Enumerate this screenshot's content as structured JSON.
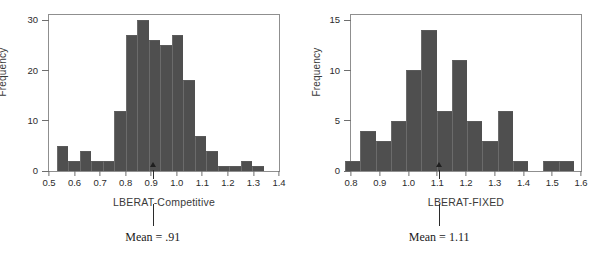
{
  "figure": {
    "panels": [
      "LBERAT-Competitive",
      "LBERAT-FIXED"
    ],
    "bar_color": "#4f4f4f",
    "axis_color": "#8f8f8f",
    "background": "#ffffff"
  },
  "left": {
    "ylabel": "Frequency",
    "xlabel": "LBERAT-Competitive",
    "mean_label": "Mean = .91",
    "yticks": [
      "0",
      "10",
      "20",
      "30"
    ],
    "xticks": [
      "0.5",
      "0.6",
      "0.7",
      "0.8",
      "0.9",
      "1.0",
      "1.1",
      "1.2",
      "1.3",
      "1.4"
    ]
  },
  "right": {
    "ylabel": "Frequency",
    "xlabel": "LBERAT-FIXED",
    "mean_label": "Mean = 1.11",
    "yticks": [
      "0",
      "5",
      "10",
      "15"
    ],
    "xticks": [
      "0.8",
      "0.9",
      "1.0",
      "1.1",
      "1.2",
      "1.3",
      "1.4",
      "1.5",
      "1.6"
    ]
  },
  "chart_data": [
    {
      "type": "bar",
      "title": "",
      "xlabel": "LBERAT-Competitive",
      "ylabel": "Frequency",
      "xlim": [
        0.5,
        1.4
      ],
      "ylim": [
        0,
        31
      ],
      "yticks": [
        0,
        10,
        20,
        30
      ],
      "xticks": [
        0.5,
        0.6,
        0.7,
        0.8,
        0.9,
        1.0,
        1.1,
        1.2,
        1.3,
        1.4
      ],
      "grid": false,
      "legend": "none",
      "bin_width": 0.045,
      "bin_starts": [
        0.53,
        0.575,
        0.62,
        0.665,
        0.71,
        0.755,
        0.8,
        0.845,
        0.89,
        0.935,
        0.98,
        1.025,
        1.07,
        1.115,
        1.16,
        1.205,
        1.25,
        1.295
      ],
      "categories": [
        "0.530",
        "0.575",
        "0.620",
        "0.665",
        "0.710",
        "0.755",
        "0.800",
        "0.845",
        "0.890",
        "0.935",
        "0.980",
        "1.025",
        "1.070",
        "1.115",
        "1.160",
        "1.205",
        "1.250",
        "1.295"
      ],
      "values": [
        5,
        2,
        4,
        2,
        2,
        12,
        27,
        30,
        26,
        25,
        27,
        18,
        7,
        4,
        1,
        1,
        2,
        1
      ],
      "annotations": [
        {
          "text": "Mean = .91",
          "x": 0.91,
          "type": "mean-arrow"
        }
      ]
    },
    {
      "type": "bar",
      "title": "",
      "xlabel": "LBERAT-FIXED",
      "ylabel": "Frequency",
      "xlim": [
        0.8,
        1.6
      ],
      "ylim": [
        0,
        15.5
      ],
      "yticks": [
        0,
        5,
        10,
        15
      ],
      "xticks": [
        0.8,
        0.9,
        1.0,
        1.1,
        1.2,
        1.3,
        1.4,
        1.5,
        1.6
      ],
      "grid": false,
      "legend": "none",
      "bin_width": 0.053,
      "bin_starts": [
        0.78,
        0.833,
        0.886,
        0.939,
        0.992,
        1.045,
        1.098,
        1.151,
        1.204,
        1.257,
        1.31,
        1.363,
        1.416,
        1.469,
        1.522
      ],
      "categories": [
        "0.780",
        "0.833",
        "0.886",
        "0.939",
        "0.992",
        "1.045",
        "1.098",
        "1.151",
        "1.204",
        "1.257",
        "1.310",
        "1.363",
        "1.416",
        "1.469",
        "1.522"
      ],
      "values": [
        1,
        4,
        3,
        5,
        10,
        14,
        6,
        11,
        5,
        3,
        6,
        1,
        0,
        1,
        1
      ],
      "annotations": [
        {
          "text": "Mean = 1.11",
          "x": 1.11,
          "type": "mean-arrow"
        }
      ]
    }
  ]
}
